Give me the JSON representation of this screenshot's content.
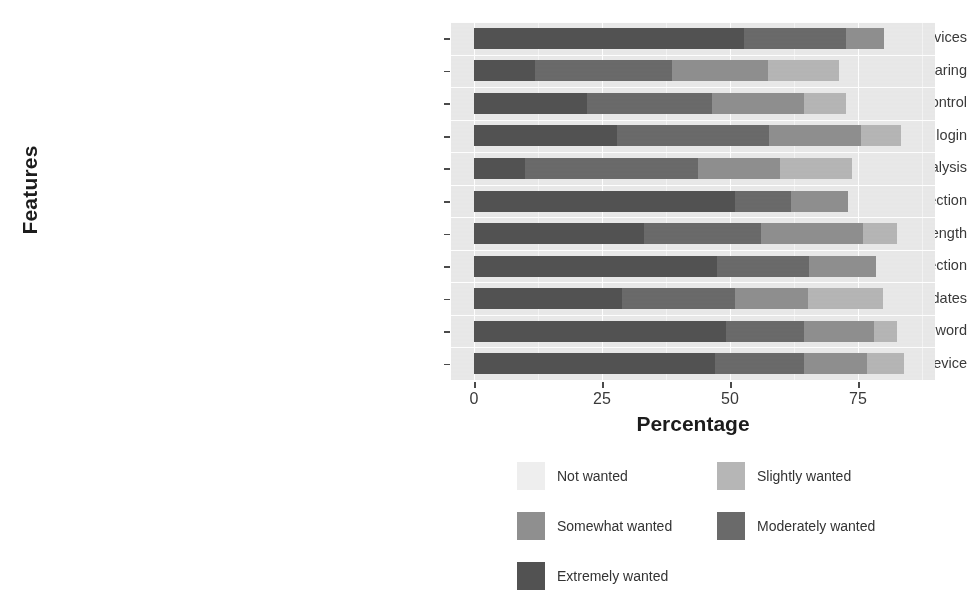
{
  "chart_data": {
    "type": "bar",
    "subtype": "stacked-horizontal-likert",
    "title": "",
    "xlabel": "Percentage",
    "ylabel": "Features",
    "xlim": [
      0,
      90
    ],
    "xticks": [
      0,
      25,
      50,
      75
    ],
    "xtick_labels": [
      "0",
      "25",
      "50",
      "75"
    ],
    "grid": true,
    "legend_position": "bottom",
    "legend_entries": [
      {
        "label": "Not wanted",
        "color": "#eeeeee"
      },
      {
        "label": "Slightly wanted",
        "color": "#b6b6b6"
      },
      {
        "label": "Somewhat wanted",
        "color": "#8f8f8f"
      },
      {
        "label": "Moderately wanted",
        "color": "#6a6a6a"
      },
      {
        "label": "Extremely wanted",
        "color": "#525252"
      }
    ],
    "series_order_in_bar": [
      "Extremely wanted",
      "Moderately wanted",
      "Somewhat wanted",
      "Slightly wanted",
      "Not wanted"
    ],
    "categories": [
      "Secure connection with all devices",
      "Role-based password sharing",
      "Role-based password for multiple access control",
      "Direct login",
      "Data visualization for traffic analysis",
      "Data breach detection",
      "Dashboard indicating password strength",
      "Anomaly detection",
      "Alerts for updates",
      "Alert for changing password",
      "Ability to disable any device"
    ],
    "series": [
      {
        "name": "Extremely wanted",
        "values": [
          52.7,
          11.9,
          22.1,
          28.0,
          10.0,
          51.0,
          33.2,
          47.5,
          29.0,
          49.2,
          47.1
        ]
      },
      {
        "name": "Moderately wanted",
        "values": [
          19.9,
          26.8,
          24.4,
          29.7,
          33.8,
          11.0,
          22.9,
          18.0,
          22.0,
          15.3,
          17.4
        ]
      },
      {
        "name": "Somewhat wanted",
        "values": [
          7.4,
          18.8,
          18.0,
          17.9,
          16.0,
          11.1,
          19.8,
          13.1,
          14.3,
          13.7,
          12.3
        ]
      },
      {
        "name": "Slightly wanted",
        "values": [
          0.0,
          13.7,
          8.2,
          7.8,
          14.1,
          0.0,
          6.8,
          0.0,
          14.6,
          4.5,
          7.2
        ]
      },
      {
        "name": "Not wanted",
        "values": [
          0.0,
          0.0,
          0.0,
          0.0,
          0.0,
          0.0,
          0.0,
          0.0,
          0.0,
          0.0,
          0.0
        ]
      }
    ],
    "row_totals": [
      80.0,
      71.2,
      72.7,
      83.4,
      73.9,
      73.1,
      82.7,
      78.6,
      79.9,
      82.7,
      84.0
    ]
  },
  "axis": {
    "y_title": "Features",
    "x_title": "Percentage"
  },
  "colors": {
    "panel_background": "#e9e9e9",
    "gridline": "#ffffff",
    "page_background": "#ffffff",
    "text": "#333333"
  }
}
